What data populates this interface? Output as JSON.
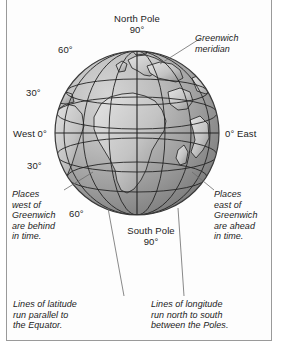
{
  "figure": {
    "type": "globe-diagram",
    "background_color": "#ffffff",
    "frame_color": "#9a9a9a",
    "globe": {
      "center_x": 137,
      "center_y": 133,
      "radius": 82,
      "ocean_light": "#c9c9c9",
      "ocean_dark": "#6e6e6e",
      "land_light": "#dedede",
      "land_dark": "#8d8d8d",
      "grid_color": "#2b2b2b",
      "outline_color": "#3a3a3a"
    },
    "graticule": {
      "latitudes_deg": [
        60,
        30,
        0,
        -30,
        -60
      ],
      "longitudes_deg": [
        -90,
        -60,
        -30,
        0,
        30,
        60,
        90
      ],
      "equator_deg": 0,
      "prime_meridian_deg": 0
    }
  },
  "labels": {
    "north_pole": "North Pole\n90°",
    "south_pole": "South Pole\n90°",
    "lat_60_north": "60°",
    "lat_30_north": "30°",
    "lat_30_south": "30°",
    "lat_60_south": "60°",
    "west_zero": "West 0°",
    "east_zero": "0° East"
  },
  "annotations": {
    "greenwich_meridian": "Greenwich\nmeridian",
    "places_west": "Places\nwest of\nGreenwich\nare behind\nin time.",
    "places_east": "Places\neast of\nGreenwich\nare ahead\nin time.",
    "lines_of_latitude": "Lines of latitude\nrun parallel to\nthe Equator.",
    "lines_of_longitude": "Lines of longitude\nrun north to south\nbetween the Poles."
  }
}
